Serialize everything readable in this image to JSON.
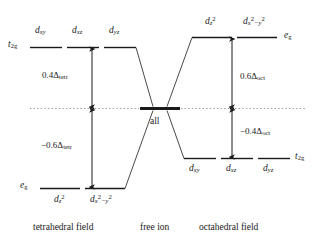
{
  "diagram": {
    "levels": {
      "tetrahedral": {
        "upper_term": "t",
        "upper_term_sub": "2g",
        "lower_term": "e",
        "lower_term_sub": "g",
        "upper_orbitals": [
          {
            "base": "d",
            "sub": "xy"
          },
          {
            "base": "d",
            "sub": "xz"
          },
          {
            "base": "d",
            "sub": "yz"
          }
        ],
        "lower_orbitals": [
          {
            "base": "d",
            "sub": "z",
            "sup": "2"
          },
          {
            "base": "d",
            "sub": "x",
            "sup": "2",
            "sub2": "−y",
            "sup2": "2"
          }
        ],
        "upper_energy": "0.4Δ",
        "upper_energy_sub": "tetr",
        "lower_energy": "−0.6Δ",
        "lower_energy_sub": "tetr"
      },
      "free_ion": {
        "label": "all"
      },
      "octahedral": {
        "upper_term": "e",
        "upper_term_sub": "g",
        "lower_term": "t",
        "lower_term_sub": "2g",
        "upper_orbitals": [
          {
            "base": "d",
            "sub": "z",
            "sup": "2"
          },
          {
            "base": "d",
            "sub": "x",
            "sup": "2",
            "sub2": "−y",
            "sup2": "2"
          }
        ],
        "lower_orbitals": [
          {
            "base": "d",
            "sub": "xy"
          },
          {
            "base": "d",
            "sub": "xz"
          },
          {
            "base": "d",
            "sub": "yz"
          }
        ],
        "upper_energy": "0.6Δ",
        "upper_energy_sub": "oct",
        "lower_energy": "−0.4Δ",
        "lower_energy_sub": "oct"
      }
    },
    "captions": {
      "left": "tetrahedral field",
      "center": "free ion",
      "right": "octahedral field"
    },
    "colors": {
      "line": "#3a3a3a",
      "level": "#1a1a1a",
      "dotted": "#9a9a9a",
      "text": "#1a1a1a",
      "background": "#ffffff"
    }
  }
}
